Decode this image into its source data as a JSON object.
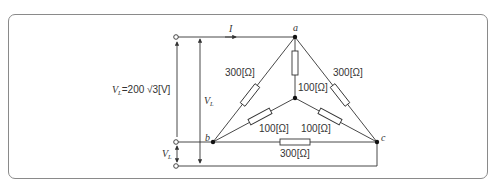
{
  "diagram": {
    "type": "three-phase circuit: delta load (300 Ω each) in parallel with wye load (100 Ω each)",
    "nodes": {
      "a": {
        "label": "a",
        "x": 295,
        "y": 37
      },
      "b": {
        "label": "b",
        "x": 213,
        "y": 142
      },
      "c": {
        "label": "c",
        "x": 377,
        "y": 142
      },
      "n": {
        "label": "",
        "x": 295,
        "y": 98
      }
    },
    "terminals": [
      {
        "id": "t1",
        "x": 175,
        "y": 37
      },
      {
        "id": "t2",
        "x": 175,
        "y": 142
      },
      {
        "id": "t3",
        "x": 175,
        "y": 166
      }
    ],
    "current_label": {
      "main": "I"
    },
    "source_voltage": {
      "main": "V",
      "sub": "L",
      "text": "=200 ",
      "sqrt": "√3",
      "unit": "[V]"
    },
    "line_voltage_label": {
      "main": "V",
      "sub": "L"
    },
    "lower_voltage_label": {
      "main": "V",
      "sub": "L"
    },
    "resistors": {
      "delta_ab": "300[Ω]",
      "delta_ac": "300[Ω]",
      "delta_bc": "300[Ω]",
      "wye_a": "100[Ω]",
      "wye_b": "100[Ω]",
      "wye_c": "100[Ω]"
    },
    "colors": {
      "line": "#333333",
      "frame": "#8a8a8a"
    }
  }
}
